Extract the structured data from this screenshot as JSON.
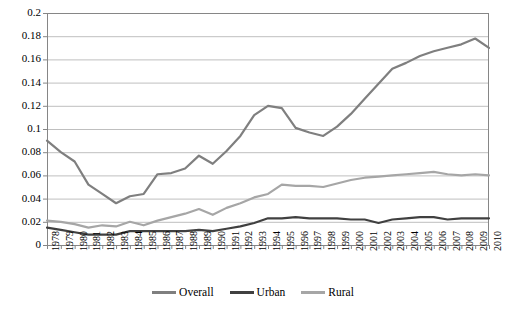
{
  "chart_data": {
    "type": "line",
    "title": "",
    "subtitle": "",
    "xlabel": "",
    "ylabel": "",
    "xlim": [
      1978,
      2010
    ],
    "ylim": [
      0,
      0.2
    ],
    "grid": true,
    "legend_position": "bottom",
    "y_ticks": [
      "0",
      "0.02",
      "0.04",
      "0.06",
      "0.08",
      "0.1",
      "0.12",
      "0.14",
      "0.16",
      "0.18",
      "0.2"
    ],
    "y_tick_values": [
      0,
      0.02,
      0.04,
      0.06,
      0.08,
      0.1,
      0.12,
      0.14,
      0.16,
      0.18,
      0.2
    ],
    "categories": [
      "1978",
      "1979",
      "1980",
      "1981",
      "1982",
      "1983",
      "1984",
      "1985",
      "1986",
      "1987",
      "1988",
      "1989",
      "1990",
      "1991",
      "1992",
      "1993",
      "1994",
      "1995",
      "1996",
      "1997",
      "1998",
      "1999",
      "2000",
      "2001",
      "2002",
      "2003",
      "2004",
      "2005",
      "2006",
      "2007",
      "2008",
      "2009",
      "2010"
    ],
    "series": [
      {
        "name": "Overall",
        "color": "#7f7f7f",
        "values": [
          0.09,
          0.08,
          0.072,
          0.052,
          0.044,
          0.036,
          0.042,
          0.044,
          0.061,
          0.062,
          0.066,
          0.077,
          0.07,
          0.081,
          0.094,
          0.112,
          0.12,
          0.118,
          0.101,
          0.097,
          0.094,
          0.102,
          0.113,
          0.126,
          0.139,
          0.152,
          0.157,
          0.163,
          0.167,
          0.17,
          0.173,
          0.178,
          0.17
        ]
      },
      {
        "name": "Urban",
        "color": "#404040",
        "values": [
          0.015,
          0.013,
          0.011,
          0.009,
          0.009,
          0.009,
          0.012,
          0.012,
          0.012,
          0.012,
          0.012,
          0.013,
          0.012,
          0.014,
          0.016,
          0.019,
          0.023,
          0.023,
          0.024,
          0.023,
          0.023,
          0.023,
          0.022,
          0.022,
          0.019,
          0.022,
          0.023,
          0.024,
          0.024,
          0.022,
          0.023,
          0.023,
          0.023
        ]
      },
      {
        "name": "Rural",
        "color": "#a6a6a6",
        "values": [
          0.021,
          0.02,
          0.018,
          0.015,
          0.017,
          0.016,
          0.02,
          0.017,
          0.021,
          0.024,
          0.027,
          0.031,
          0.026,
          0.032,
          0.036,
          0.041,
          0.044,
          0.052,
          0.051,
          0.051,
          0.05,
          0.053,
          0.056,
          0.058,
          0.059,
          0.06,
          0.061,
          0.062,
          0.063,
          0.061,
          0.06,
          0.061,
          0.06
        ]
      }
    ]
  },
  "legend": {
    "items": [
      {
        "label": "Overall",
        "color": "#7f7f7f"
      },
      {
        "label": "Urban",
        "color": "#404040"
      },
      {
        "label": "Rural",
        "color": "#a6a6a6"
      }
    ]
  },
  "style": {
    "grid_color": "#bfbfbf",
    "axis_color": "#868686",
    "plot_background": "#ffffff"
  }
}
